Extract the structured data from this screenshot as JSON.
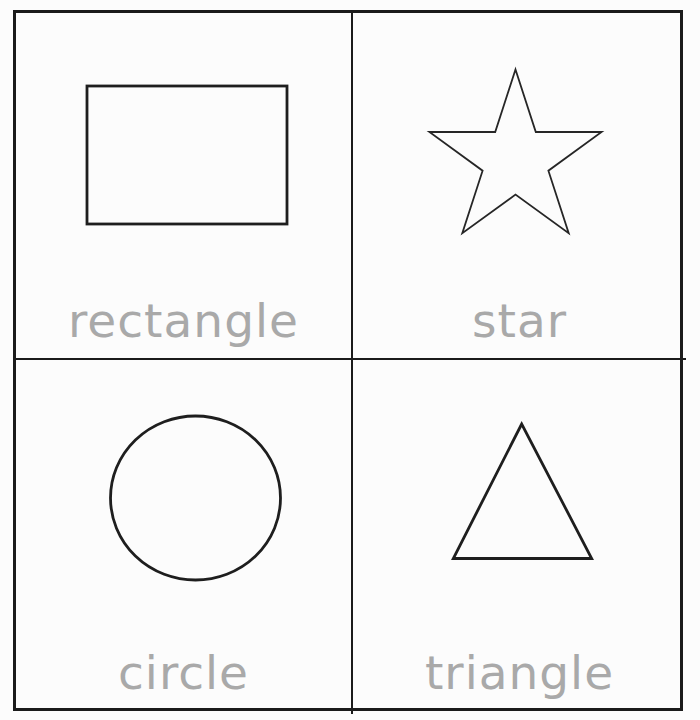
{
  "theme": {
    "page_bg": "#fcfcfc",
    "line_color": "#1b1b1b",
    "label_color": "#a9a9a9"
  },
  "grid": {
    "rows": 2,
    "cols": 2
  },
  "cards": [
    {
      "position": "top-left",
      "icon": "rectangle-shape-icon",
      "label": "rectangle"
    },
    {
      "position": "top-right",
      "icon": "star-shape-icon",
      "label": "star"
    },
    {
      "position": "bottom-left",
      "icon": "circle-shape-icon",
      "label": "circle"
    },
    {
      "position": "bottom-right",
      "icon": "triangle-shape-icon",
      "label": "triangle"
    }
  ]
}
